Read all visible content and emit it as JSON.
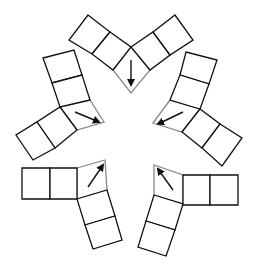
{
  "diagram": {
    "title": "",
    "colors": {
      "outline": "#111111",
      "corner_outline": "#888888",
      "arrow": "#111111",
      "background": "#ffffff"
    },
    "pieces": [
      {
        "name": "top",
        "squares": [
          "88,15 110,32 92,54 69,40",
          "110,32 131,47 113,70 92,54",
          "131,47 153,32 170,55 150,70",
          "153,32 175,15 193,40 170,55"
        ],
        "corner": "131,47 150,70 131,93 113,70",
        "arrow": {
          "x1": 131,
          "y1": 60,
          "x2": 131,
          "y2": 85,
          "direction": "down"
        }
      },
      {
        "name": "upper-left",
        "squares": [
          "43,58 74,50 82,75 52,83",
          "52,83 82,75 90,100 60,107",
          "60,107 77,130 55,148 37,122",
          "37,122 55,148 33,160 16,135"
        ],
        "corner": "60,107 90,100 104,122 77,130",
        "arrow": {
          "x1": 75,
          "y1": 112,
          "x2": 99,
          "y2": 122,
          "direction": "down-right"
        }
      },
      {
        "name": "upper-right",
        "squares": [
          "186,52 217,60 209,84 180,75",
          "180,75 209,84 200,109 170,100",
          "200,109 220,124 202,148 182,132",
          "220,124 242,138 222,166 202,148"
        ],
        "corner": "170,100 200,109 182,132 153,123",
        "arrow": {
          "x1": 183,
          "y1": 112,
          "x2": 158,
          "y2": 124,
          "direction": "down-left"
        }
      },
      {
        "name": "lower-left",
        "squares": [
          "22,168 50,168 50,199 22,199",
          "50,168 77,168 77,199 50,199",
          "77,199 107,190 115,216 85,225",
          "85,225 115,216 122,240 93,249"
        ],
        "corner": "77,168 105,160 107,190 77,199",
        "arrow": {
          "x1": 88,
          "y1": 187,
          "x2": 103,
          "y2": 165,
          "direction": "up-right"
        }
      },
      {
        "name": "lower-right",
        "squares": [
          "183,175 210,175 210,205 183,205",
          "210,175 238,175 238,205 210,205",
          "154,195 183,204 175,230 146,221",
          "146,221 175,230 166,256 138,247"
        ],
        "corner": "154,165 183,175 183,204 154,195",
        "arrow": {
          "x1": 173,
          "y1": 190,
          "x2": 158,
          "y2": 169,
          "direction": "up-left"
        }
      }
    ]
  }
}
